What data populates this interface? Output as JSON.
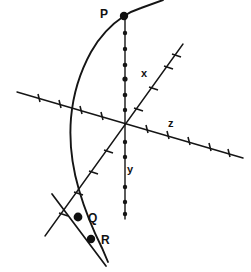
{
  "figure": {
    "background_color": "#ffffff",
    "stroke_color": "#151515",
    "width": 251,
    "height": 272
  },
  "axes": [
    {
      "id": "x",
      "label": "x",
      "label_x": 146,
      "label_y": 77,
      "description": "oblique axis rising to the upper right",
      "start": {
        "x": 45,
        "y": 236
      },
      "end": {
        "x": 183,
        "y": 44
      },
      "tick_style": "dash",
      "tick_count": 9
    },
    {
      "id": "y",
      "label": "y",
      "label_x": 131,
      "label_y": 173,
      "description": "vertical axis",
      "start": {
        "x": 125,
        "y": 15
      },
      "end": {
        "x": 125,
        "y": 219
      },
      "tick_style": "dot",
      "tick_count": 12
    },
    {
      "id": "z",
      "label": "z",
      "label_x": 168,
      "label_y": 127,
      "description": "oblique axis descending to the right",
      "start": {
        "x": 17,
        "y": 92
      },
      "end": {
        "x": 243,
        "y": 158
      },
      "tick_style": "dash",
      "tick_count": 11
    }
  ],
  "origin": {
    "x": 125,
    "y": 124
  },
  "curve": {
    "id": "arc-curve",
    "description": "arc entering from upper right, bending left through P and descending past the axes",
    "path": "M 163 0 L 141 8 C 132 11 127 14 124 16 C 112 24 100 36 91 52 C 80 72 73 95 71 118 C 69 142 72 166 79 190 C 84 207 92 228 102 248 L 108 262"
  },
  "secant": {
    "id": "secant-line",
    "description": "straight line descending to the lower right through Q and R",
    "start": {
      "x": 52,
      "y": 194
    },
    "end": {
      "x": 106,
      "y": 266
    }
  },
  "points": [
    {
      "id": "P",
      "label": "P",
      "x": 124,
      "y": 16,
      "radius": 4.2,
      "label_x": 105,
      "label_y": 18,
      "description": "intersection of curve and y-axis"
    },
    {
      "id": "Q",
      "label": "Q",
      "x": 78,
      "y": 217,
      "radius": 4.4,
      "label_x": 88,
      "label_y": 222,
      "description": "point on the curve below the x-axis crossing"
    },
    {
      "id": "R",
      "label": "R",
      "x": 91,
      "y": 239,
      "radius": 4.2,
      "label_x": 101,
      "label_y": 244,
      "description": "point further along the secant line"
    }
  ]
}
